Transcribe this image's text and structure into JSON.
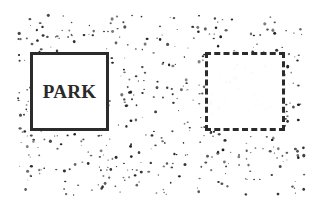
{
  "diagram": {
    "solid_box": {
      "label": "PARK",
      "border_style": "solid",
      "color": "#2b2b2b"
    },
    "dashed_box": {
      "label": "",
      "border_style": "dashed",
      "color": "#2b2b2b"
    },
    "background": {
      "pattern": "random-speckle",
      "dot_color": "#1a1a1a"
    }
  }
}
